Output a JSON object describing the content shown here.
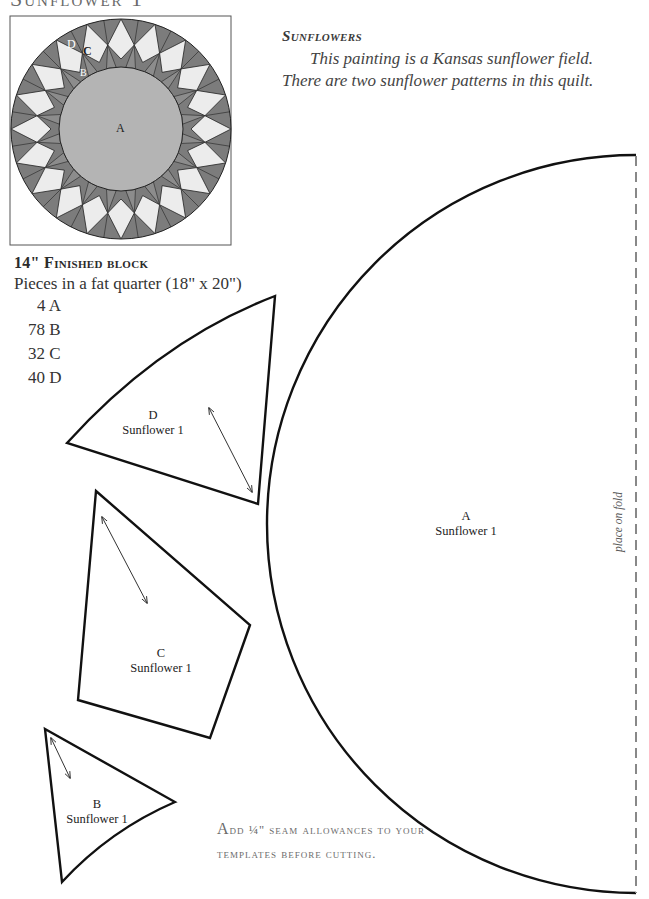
{
  "page": {
    "title": "Sunflower 1"
  },
  "block_image": {
    "labels": {
      "a": "A",
      "b": "B",
      "c": "C",
      "d": "D"
    },
    "colors": {
      "dark": "#7c7c7c",
      "light": "#ececec",
      "center": "#b4b4b4",
      "outline": "#222222"
    },
    "points": 20
  },
  "intro": {
    "heading": "Sunflowers",
    "line1": "This painting is a Kansas sunflower field.",
    "line2": "There are two sunflower patterns in this quilt."
  },
  "block_info": {
    "heading": "14\" Finished block",
    "pieces_line": "Pieces in a fat quarter (18\" x 20\")",
    "counts": [
      {
        "label": "4 A"
      },
      {
        "label": "78 B"
      },
      {
        "label": "32 C"
      },
      {
        "label": "40 D"
      }
    ]
  },
  "templates": {
    "d": {
      "letter": "D",
      "name": "Sunflower 1"
    },
    "c": {
      "letter": "C",
      "name": "Sunflower 1"
    },
    "b": {
      "letter": "B",
      "name": "Sunflower 1"
    },
    "a": {
      "letter": "A",
      "name": "Sunflower 1"
    },
    "fold_label": "place on fold"
  },
  "seam_note": {
    "first_letter": "A",
    "line1_rest": "dd ¼\" seam allowances to your",
    "line2": "templates before cutting."
  }
}
